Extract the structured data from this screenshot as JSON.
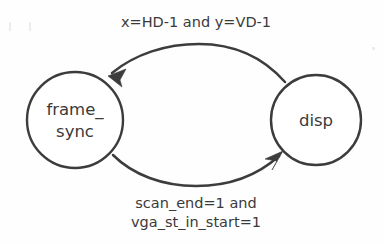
{
  "diagram": {
    "type": "state-transition-diagram",
    "background_color": "#fefefe",
    "stroke_color": "#3c3c3c",
    "text_color": "#3a3a3a",
    "states": [
      {
        "id": "frame_sync",
        "label_line1": "frame_",
        "label_line2": "sync",
        "cx": 75,
        "cy": 120,
        "r": 48
      },
      {
        "id": "disp",
        "label_line1": "disp",
        "label_line2": "",
        "cx": 316,
        "cy": 120,
        "r": 45
      }
    ],
    "transitions": [
      {
        "id": "disp-to-frame-sync",
        "from": "disp",
        "to": "frame_sync",
        "position": "top",
        "label_line1": "x=HD-1 and y=VD-1",
        "label_line2": "",
        "label_x": 196,
        "label_y": 23
      },
      {
        "id": "frame-sync-to-disp",
        "from": "frame_sync",
        "to": "disp",
        "position": "bottom",
        "label_line1": "scan_end=1 and",
        "label_line2": "vga_st_in_start=1",
        "label_x": 196,
        "label_y": 204
      }
    ]
  }
}
